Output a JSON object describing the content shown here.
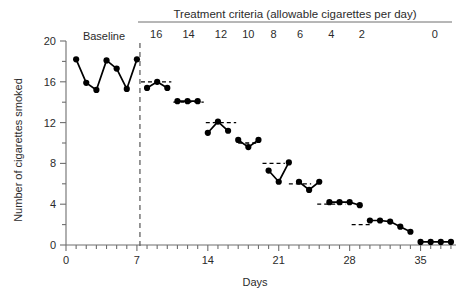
{
  "chart_data": {
    "type": "line",
    "title": "",
    "xlabel": "Days",
    "ylabel": "Number of cigarettes smoked",
    "xlim": [
      0,
      38.5
    ],
    "ylim": [
      0,
      20
    ],
    "xticks_major": [
      0,
      7,
      14,
      21,
      28,
      35
    ],
    "xticks_minor_step": 1,
    "yticks_major": [
      0,
      4,
      8,
      12,
      16,
      20
    ],
    "yticks_minor_step": 2,
    "grid": false,
    "legend": null,
    "phase_label": "Baseline",
    "phase_change_day": 7.3,
    "criteria_header": "Treatment criteria (allowable cigarettes per day)",
    "criteria_values": [
      16,
      14,
      12,
      10,
      8,
      6,
      4,
      2,
      0
    ],
    "criteria_lines": [
      {
        "value": 16,
        "x_start": 7.4,
        "x_end": 10.4
      },
      {
        "value": 14,
        "x_start": 10.6,
        "x_end": 13.6
      },
      {
        "value": 12,
        "x_start": 13.8,
        "x_end": 16.8
      },
      {
        "value": 10,
        "x_start": 17.0,
        "x_end": 19.0
      },
      {
        "value": 8,
        "x_start": 19.4,
        "x_end": 21.6
      },
      {
        "value": 6,
        "x_start": 22.0,
        "x_end": 24.2
      },
      {
        "value": 4,
        "x_start": 24.8,
        "x_end": 27.6
      },
      {
        "value": 2,
        "x_start": 28.2,
        "x_end": 30.2
      },
      {
        "value": 0,
        "x_start": 34.6,
        "x_end": 38.2
      }
    ],
    "series": [
      {
        "name": "Cigarettes smoked per day",
        "segments": [
          {
            "phase": "baseline",
            "x": [
              1,
              2,
              3,
              4,
              5,
              6,
              7
            ],
            "y": [
              18.2,
              15.9,
              15.2,
              18.1,
              17.3,
              15.3,
              18.2
            ]
          },
          {
            "phase": "criterion-16",
            "x": [
              8,
              9,
              10
            ],
            "y": [
              15.4,
              16.0,
              15.4
            ]
          },
          {
            "phase": "criterion-14",
            "x": [
              11,
              12,
              13
            ],
            "y": [
              14.1,
              14.1,
              14.1
            ]
          },
          {
            "phase": "criterion-12",
            "x": [
              14,
              15,
              16
            ],
            "y": [
              11.0,
              12.1,
              11.2
            ]
          },
          {
            "phase": "criterion-10",
            "x": [
              17,
              18,
              19
            ],
            "y": [
              10.3,
              9.6,
              10.3
            ]
          },
          {
            "phase": "criterion-8",
            "x": [
              20,
              21,
              22
            ],
            "y": [
              7.3,
              6.2,
              8.1
            ]
          },
          {
            "phase": "criterion-6",
            "x": [
              23,
              24,
              25
            ],
            "y": [
              6.2,
              5.4,
              6.2
            ]
          },
          {
            "phase": "criterion-4",
            "x": [
              26,
              27,
              28,
              29
            ],
            "y": [
              4.2,
              4.2,
              4.2,
              3.9
            ]
          },
          {
            "phase": "criterion-2",
            "x": [
              30,
              31,
              32,
              33,
              34
            ],
            "y": [
              2.4,
              2.4,
              2.3,
              1.8,
              1.3
            ]
          },
          {
            "phase": "criterion-0",
            "x": [
              35,
              36,
              37,
              38
            ],
            "y": [
              0.3,
              0.3,
              0.3,
              0.3
            ]
          }
        ]
      }
    ]
  }
}
